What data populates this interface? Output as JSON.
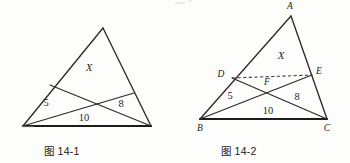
{
  "page": {
    "background": "#fdfdfc",
    "ink": "#2b2b2b",
    "width": 350,
    "height": 163
  },
  "figures": [
    {
      "id": "fig-14-1",
      "caption": "图 14-1",
      "description": "Triangle with two cevians from the base vertices crossing inside, forming four regions",
      "labels": {
        "region_x": "X",
        "area_left": "5",
        "area_bottom": "10",
        "area_right": "8"
      },
      "vertices": {
        "apex": {
          "x": 103,
          "y": 28
        },
        "bottom_left": {
          "x": 23,
          "y": 126
        },
        "bottom_right": {
          "x": 151,
          "y": 126
        }
      },
      "cevian_feet": {
        "on_left_side": {
          "x": 50,
          "y": 85
        },
        "on_right_side": {
          "x": 134,
          "y": 93
        }
      },
      "crossing": {
        "x": 88,
        "y": 103
      },
      "label_positions": {
        "region_x": {
          "x": 89,
          "y": 71
        },
        "area_left": {
          "x": 46,
          "y": 106
        },
        "area_bottom": {
          "x": 84,
          "y": 121
        },
        "area_right": {
          "x": 121,
          "y": 107
        }
      }
    },
    {
      "id": "fig-14-2",
      "caption": "图 14-2",
      "description": "Same triangle labelled A B C with cevians BE and CD meeting at F, and dashed segment DE",
      "labels": {
        "region_x": "X",
        "area_left": "5",
        "area_bottom": "10",
        "area_right": "8",
        "vertex_a": "A",
        "vertex_b": "B",
        "vertex_c": "C",
        "point_d": "D",
        "point_e": "E",
        "point_f": "F"
      },
      "vertices": {
        "A": {
          "x": 116,
          "y": 16
        },
        "B": {
          "x": 25,
          "y": 119
        },
        "C": {
          "x": 152,
          "y": 119
        }
      },
      "points": {
        "D": {
          "x": 57,
          "y": 78
        },
        "E": {
          "x": 137,
          "y": 75
        },
        "F": {
          "x": 95,
          "y": 87
        }
      },
      "label_positions": {
        "A": {
          "x": 115,
          "y": 9
        },
        "B": {
          "x": 25,
          "y": 131
        },
        "C": {
          "x": 152,
          "y": 131
        },
        "D": {
          "x": 46,
          "y": 77
        },
        "E": {
          "x": 143,
          "y": 74
        },
        "F": {
          "x": 92,
          "y": 85
        },
        "region_x": {
          "x": 106,
          "y": 59
        },
        "area_left": {
          "x": 55,
          "y": 99
        },
        "area_bottom": {
          "x": 93,
          "y": 114
        },
        "area_right": {
          "x": 122,
          "y": 100
        }
      }
    }
  ]
}
